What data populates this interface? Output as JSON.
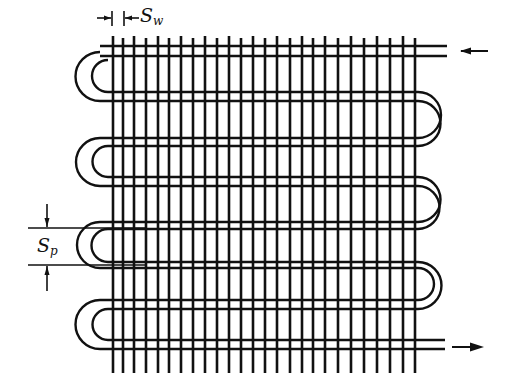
{
  "diagram": {
    "stroke_color": "#111111",
    "background": "#ffffff",
    "labels": {
      "wire_spacing": {
        "main": "S",
        "sub": "w"
      },
      "tube_pitch": {
        "main": "S",
        "sub": "p"
      }
    },
    "flow": {
      "inlet_arrow": "left-arrow",
      "outlet_arrow": "right-arrow"
    },
    "wires_x": [
      113,
      123,
      134,
      146,
      158,
      169,
      181,
      193,
      205,
      217,
      229,
      241,
      253,
      265,
      272,
      285,
      298,
      311,
      324,
      338,
      351,
      364,
      377,
      390,
      404,
      415
    ],
    "wire_top_y": 36,
    "wire_bottom_y": 373,
    "tube_passes": [
      {
        "y_outer": 46,
        "y_inner": 56
      },
      {
        "y_outer": 52,
        "y_inner": 60
      },
      {
        "y_outer": 101,
        "y_inner": 92
      },
      {
        "y_outer": 138,
        "y_inner": 146
      },
      {
        "y_outer": 186,
        "y_inner": 177
      },
      {
        "y_outer": 222,
        "y_inner": 229
      },
      {
        "y_outer": 268,
        "y_inner": 262
      },
      {
        "y_outer": 300,
        "y_inner": 309
      },
      {
        "y_outer": 349,
        "y_inner": 340
      }
    ]
  }
}
